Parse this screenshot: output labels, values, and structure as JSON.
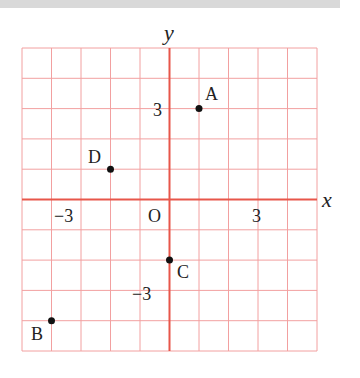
{
  "chart_data": {
    "type": "scatter",
    "title": "",
    "xlabel": "x",
    "ylabel": "y",
    "xlim": [
      -5,
      5
    ],
    "ylim": [
      -5,
      5
    ],
    "grid": true,
    "origin_label": "O",
    "x_ticks": [
      {
        "value": -3,
        "label": "−3"
      },
      {
        "value": 3,
        "label": "3"
      }
    ],
    "y_ticks": [
      {
        "value": 3,
        "label": "3"
      },
      {
        "value": -3,
        "label": "−3"
      }
    ],
    "points": [
      {
        "label": "A",
        "x": 1,
        "y": 3
      },
      {
        "label": "B",
        "x": -4,
        "y": -4
      },
      {
        "label": "C",
        "x": 0,
        "y": -2
      },
      {
        "label": "D",
        "x": -2,
        "y": 1
      }
    ]
  },
  "colors": {
    "grid": "#f2a0a0",
    "axis": "#e8564a",
    "point": "#111111",
    "text": "#222222"
  },
  "labels": {
    "x_axis": "x",
    "y_axis": "y",
    "origin": "O",
    "x_tick_neg3": "−3",
    "x_tick_3": "3",
    "y_tick_3": "3",
    "y_tick_neg3": "−3",
    "point_a": "A",
    "point_b": "B",
    "point_c": "C",
    "point_d": "D"
  }
}
